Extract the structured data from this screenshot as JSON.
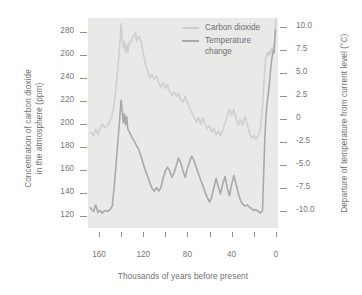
{
  "chart_data": {
    "type": "line",
    "title": "",
    "subtitle": "",
    "xlabel": "Thousands of years before present",
    "ylabel": "Concentration of carbon dioxide in the atmosphere (ppm)",
    "y2label": "Departure of temperature from current level (°C)",
    "grid": false,
    "legend_position": "top-center-right",
    "x_axis": {
      "label": "Thousands of years before present",
      "ticks": [
        160,
        140,
        120,
        100,
        80,
        60,
        40,
        20,
        0
      ],
      "tick_labels": [
        "160",
        "",
        "120",
        "",
        "80",
        "",
        "40",
        "",
        "0"
      ],
      "range": [
        170,
        -2
      ],
      "direction": "reversed"
    },
    "y_left_axis": {
      "label_line1": "Concentration of carbon dioxide",
      "label_line2": "in the atmosphere (ppm)",
      "unit": "ppm",
      "ticks": [
        280,
        260,
        240,
        220,
        200,
        180,
        160,
        140,
        120
      ],
      "tick_labels": [
        "280",
        "260",
        "240",
        "220",
        "200",
        "180",
        "160",
        "140",
        "120"
      ],
      "range": [
        110,
        292
      ]
    },
    "y_right_axis": {
      "label": "Departure of temperature from current level (°C)",
      "unit": "°C",
      "ticks": [
        10.0,
        7.5,
        5.0,
        2.5,
        0,
        -2.5,
        -5.0,
        -7.5,
        -10.0
      ],
      "tick_labels": [
        "10.0",
        "7.5",
        "5.0",
        "2.5",
        "0",
        "-2.5",
        "-5.0",
        "-7.5",
        "-10.0"
      ],
      "range": [
        -11.8,
        11.0
      ]
    },
    "series": [
      {
        "name": "Carbon dioxide",
        "color": "#cfcfcb",
        "axis": "left",
        "unit": "ppm",
        "points": [
          [
            168,
            193
          ],
          [
            165,
            190
          ],
          [
            163,
            196
          ],
          [
            161,
            191
          ],
          [
            159,
            196
          ],
          [
            157,
            200
          ],
          [
            155,
            197
          ],
          [
            152,
            199
          ],
          [
            150,
            203
          ],
          [
            148,
            209
          ],
          [
            146,
            219
          ],
          [
            144,
            238
          ],
          [
            142,
            258
          ],
          [
            141,
            272
          ],
          [
            140,
            287
          ],
          [
            139,
            272
          ],
          [
            138,
            266
          ],
          [
            137,
            272
          ],
          [
            136,
            262
          ],
          [
            135,
            269
          ],
          [
            134,
            262
          ],
          [
            133,
            270
          ],
          [
            131,
            272
          ],
          [
            129,
            276
          ],
          [
            127,
            279
          ],
          [
            126,
            272
          ],
          [
            124,
            276
          ],
          [
            122,
            272
          ],
          [
            120,
            262
          ],
          [
            118,
            252
          ],
          [
            116,
            246
          ],
          [
            114,
            240
          ],
          [
            112,
            243
          ],
          [
            110,
            239
          ],
          [
            108,
            242
          ],
          [
            106,
            236
          ],
          [
            104,
            232
          ],
          [
            102,
            236
          ],
          [
            100,
            231
          ],
          [
            98,
            234
          ],
          [
            96,
            228
          ],
          [
            94,
            225
          ],
          [
            92,
            228
          ],
          [
            90,
            224
          ],
          [
            88,
            227
          ],
          [
            86,
            221
          ],
          [
            84,
            219
          ],
          [
            82,
            224
          ],
          [
            80,
            219
          ],
          [
            78,
            214
          ],
          [
            76,
            210
          ],
          [
            74,
            206
          ],
          [
            72,
            202
          ],
          [
            70,
            206
          ],
          [
            68,
            200
          ],
          [
            66,
            205
          ],
          [
            64,
            200
          ],
          [
            62,
            196
          ],
          [
            60,
            199
          ],
          [
            58,
            193
          ],
          [
            56,
            196
          ],
          [
            54,
            191
          ],
          [
            52,
            194
          ],
          [
            50,
            190
          ],
          [
            48,
            195
          ],
          [
            46,
            201
          ],
          [
            44,
            207
          ],
          [
            42,
            213
          ],
          [
            40,
            208
          ],
          [
            38,
            213
          ],
          [
            36,
            205
          ],
          [
            34,
            199
          ],
          [
            32,
            204
          ],
          [
            30,
            199
          ],
          [
            28,
            207
          ],
          [
            26,
            200
          ],
          [
            24,
            193
          ],
          [
            22,
            188
          ],
          [
            20,
            190
          ],
          [
            18,
            187
          ],
          [
            16,
            190
          ],
          [
            14,
            196
          ],
          [
            12,
            215
          ],
          [
            11,
            232
          ],
          [
            10,
            248
          ],
          [
            9,
            258
          ],
          [
            8,
            262
          ],
          [
            7,
            259
          ],
          [
            6,
            263
          ],
          [
            5,
            260
          ],
          [
            4,
            266
          ],
          [
            3,
            262
          ],
          [
            2,
            268
          ],
          [
            1,
            272
          ],
          [
            0.5,
            284
          ],
          [
            0.2,
            291
          ]
        ]
      },
      {
        "name": "Temperature change",
        "color": "#a9a9a5",
        "axis": "right",
        "unit": "°C",
        "points": [
          [
            168,
            -9.6
          ],
          [
            165,
            -10.0
          ],
          [
            163,
            -9.3
          ],
          [
            161,
            -10.1
          ],
          [
            159,
            -9.9
          ],
          [
            157,
            -10.2
          ],
          [
            155,
            -9.9
          ],
          [
            152,
            -10.0
          ],
          [
            150,
            -9.8
          ],
          [
            148,
            -9.4
          ],
          [
            146,
            -7.0
          ],
          [
            144,
            -4.0
          ],
          [
            142,
            -1.0
          ],
          [
            141,
            0.6
          ],
          [
            140,
            2.1
          ],
          [
            139,
            0.9
          ],
          [
            138,
            -0.4
          ],
          [
            137,
            0.6
          ],
          [
            136,
            -0.6
          ],
          [
            135,
            0.3
          ],
          [
            134,
            -1.0
          ],
          [
            132,
            -1.5
          ],
          [
            130,
            -2.0
          ],
          [
            128,
            -2.4
          ],
          [
            126,
            -2.9
          ],
          [
            124,
            -3.3
          ],
          [
            122,
            -4.0
          ],
          [
            120,
            -4.8
          ],
          [
            118,
            -5.6
          ],
          [
            116,
            -6.2
          ],
          [
            114,
            -6.9
          ],
          [
            112,
            -7.5
          ],
          [
            110,
            -7.8
          ],
          [
            108,
            -7.4
          ],
          [
            106,
            -7.8
          ],
          [
            104,
            -7.4
          ],
          [
            102,
            -6.4
          ],
          [
            100,
            -5.6
          ],
          [
            98,
            -5.2
          ],
          [
            96,
            -5.6
          ],
          [
            94,
            -6.3
          ],
          [
            92,
            -5.8
          ],
          [
            90,
            -5.0
          ],
          [
            88,
            -4.2
          ],
          [
            86,
            -4.7
          ],
          [
            84,
            -5.6
          ],
          [
            82,
            -6.3
          ],
          [
            80,
            -5.3
          ],
          [
            78,
            -4.6
          ],
          [
            76,
            -4.0
          ],
          [
            74,
            -4.5
          ],
          [
            72,
            -5.2
          ],
          [
            70,
            -5.9
          ],
          [
            68,
            -6.6
          ],
          [
            66,
            -7.2
          ],
          [
            64,
            -7.9
          ],
          [
            62,
            -8.5
          ],
          [
            60,
            -9.0
          ],
          [
            58,
            -8.4
          ],
          [
            56,
            -7.4
          ],
          [
            54,
            -6.4
          ],
          [
            52,
            -7.3
          ],
          [
            50,
            -8.1
          ],
          [
            48,
            -7.0
          ],
          [
            46,
            -6.2
          ],
          [
            44,
            -7.4
          ],
          [
            42,
            -8.3
          ],
          [
            40,
            -7.1
          ],
          [
            38,
            -6.1
          ],
          [
            36,
            -7.0
          ],
          [
            34,
            -8.0
          ],
          [
            32,
            -8.8
          ],
          [
            30,
            -9.2
          ],
          [
            28,
            -9.4
          ],
          [
            26,
            -9.3
          ],
          [
            24,
            -9.5
          ],
          [
            22,
            -9.7
          ],
          [
            20,
            -9.9
          ],
          [
            18,
            -9.8
          ],
          [
            16,
            -10.0
          ],
          [
            14,
            -10.2
          ],
          [
            12,
            -9.9
          ],
          [
            11,
            -6.0
          ],
          [
            10,
            -2.4
          ],
          [
            9,
            0.2
          ],
          [
            8,
            1.6
          ],
          [
            7,
            2.6
          ],
          [
            6,
            3.6
          ],
          [
            5,
            5.0
          ],
          [
            4,
            6.2
          ],
          [
            3,
            7.0
          ],
          [
            2,
            7.6
          ],
          [
            1.5,
            7.2
          ],
          [
            1,
            8.4
          ],
          [
            0.6,
            9.1
          ],
          [
            0.2,
            9.7
          ]
        ]
      }
    ]
  },
  "legend": {
    "entries": [
      {
        "label": "Carbon dioxide",
        "color": "#cfcfcb"
      },
      {
        "label": "Temperature\nchange",
        "color": "#a9a9a5"
      }
    ]
  },
  "axis_titles": {
    "y_left_line1": "Concentration of carbon dioxide",
    "y_left_line2": "in the atmosphere (ppm)",
    "y_right": "Departure of temperature from current level (°C)",
    "x": "Thousands of years before present"
  },
  "tick_labels": {
    "left": [
      "280",
      "260",
      "240",
      "220",
      "200",
      "180",
      "160",
      "140",
      "120"
    ],
    "right": [
      "10.0",
      "7.5",
      "5.0",
      "2.5",
      "0",
      "-2.5",
      "-5.0",
      "-7.5",
      "-10.0"
    ],
    "bottom": [
      "160",
      "120",
      "80",
      "40",
      "0"
    ]
  },
  "colors": {
    "plot_background": "#e9e9e7",
    "page_background": "#ffffff",
    "co2_line": "#cfcfcb",
    "temperature_line": "#a9a9a5",
    "text": "#6f6f6f",
    "tick_mark": "#8e8e8e"
  }
}
